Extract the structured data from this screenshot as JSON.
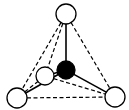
{
  "diagram": {
    "type": "tetrahedral-molecule",
    "colors": {
      "background": "#ffffff",
      "stroke": "#000000",
      "central_atom_fill": "#000000",
      "outer_atom_fill": "#ffffff"
    },
    "atoms": [
      {
        "id": "top",
        "cx": 66,
        "cy": 14,
        "r": 10,
        "fill": "#ffffff"
      },
      {
        "id": "back-left",
        "cx": 45,
        "cy": 76,
        "r": 9,
        "fill": "#ffffff"
      },
      {
        "id": "bottom-left",
        "cx": 17,
        "cy": 98,
        "r": 10,
        "fill": "#ffffff"
      },
      {
        "id": "bottom-right",
        "cx": 115,
        "cy": 97,
        "r": 10,
        "fill": "#ffffff"
      },
      {
        "id": "center",
        "cx": 66,
        "cy": 70,
        "r": 9,
        "fill": "#000000"
      }
    ],
    "bonds_solid": [
      {
        "from": "center",
        "to": "top"
      },
      {
        "from": "center",
        "to": "back-left"
      },
      {
        "from": "center",
        "to": "bottom-left"
      },
      {
        "from": "center",
        "to": "bottom-right"
      }
    ],
    "edges_dashed": [
      {
        "from": "top",
        "to": "bottom-left"
      },
      {
        "from": "top",
        "to": "back-left"
      },
      {
        "from": "top",
        "to": "bottom-right"
      },
      {
        "from": "bottom-left",
        "to": "bottom-right"
      },
      {
        "from": "back-left",
        "to": "bottom-right"
      },
      {
        "from": "bottom-left",
        "to": "back-left"
      }
    ]
  }
}
